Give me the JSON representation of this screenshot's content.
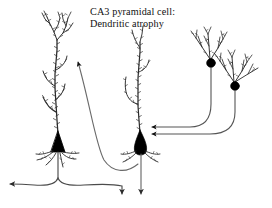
{
  "figure": {
    "title_line_1": "CA3 pyramidal cell:",
    "title_line_2": "Dendritic atrophy",
    "background_color": "#ffffff",
    "ink_color": "#1a1a1a",
    "soma_fill_color": "#000000",
    "axon_color": "#4a4a4a"
  },
  "cells": [
    {
      "id": "left-pyramidal-cell",
      "label": "Control CA3 pyramidal cell",
      "soma_shape": "filled-triangle",
      "soma_x": 58,
      "soma_y": 142,
      "dendrite_state": "elaborate-branched-spiny",
      "branch_count": 9,
      "apical_height": 118,
      "axon_pattern": "descends-then-T-bifurcates",
      "axon_terminals": 2
    },
    {
      "id": "middle-pyramidal-cell",
      "label": "Atrophied CA3 pyramidal cell",
      "soma_shape": "filled-teardrop",
      "soma_x": 141,
      "soma_y": 143,
      "dendrite_state": "sparse-atrophied-spiny",
      "branch_count": 3,
      "apical_height": 100,
      "axon_pattern": "descends-straight",
      "axon_terminals": 1
    },
    {
      "id": "right-upper-granule-cell",
      "label": "Granule cell (upper)",
      "soma_shape": "filled-circle",
      "soma_x": 211,
      "soma_y": 63,
      "dendrite_state": "fan-shaped-branched",
      "axon_pattern": "descends-then-curves-left-to-arrowhead"
    },
    {
      "id": "right-lower-granule-cell",
      "label": "Granule cell (lower)",
      "soma_shape": "filled-circle",
      "soma_x": 235,
      "soma_y": 86,
      "dendrite_state": "fan-shaped-branched",
      "axon_pattern": "descends-then-curves-left-to-arrowhead"
    }
  ],
  "connections": [
    {
      "id": "granule-upper-to-middle-cell",
      "from": "right-upper-granule-cell",
      "to": "middle-pyramidal-cell",
      "marker": "arrowhead",
      "target_y": 127
    },
    {
      "id": "granule-lower-to-middle-cell",
      "from": "right-lower-granule-cell",
      "to": "middle-pyramidal-cell",
      "marker": "arrowhead",
      "target_y": 134
    },
    {
      "id": "middle-cell-to-left-cell",
      "from": "middle-pyramidal-cell",
      "to": "left-pyramidal-cell",
      "marker": "arrowhead",
      "target_x": 74,
      "target_y": 52
    },
    {
      "id": "left-cell-axon-left-terminal",
      "from": "left-pyramidal-cell",
      "to": "left-edge",
      "marker": "arrowhead",
      "target_x": 6,
      "target_y": 184
    },
    {
      "id": "left-cell-axon-down-terminal",
      "from": "left-pyramidal-cell",
      "to": "bottom",
      "marker": "arrowhead",
      "target_x": 122,
      "target_y": 198
    },
    {
      "id": "middle-cell-axon-down-terminal",
      "from": "middle-pyramidal-cell",
      "to": "bottom",
      "marker": "arrowhead",
      "target_x": 141,
      "target_y": 198
    }
  ]
}
